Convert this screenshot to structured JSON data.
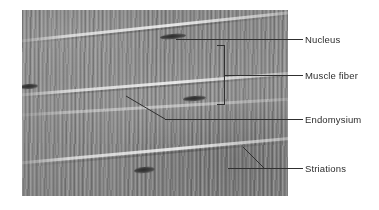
{
  "figure": {
    "type": "light-micrograph-labeled-diagram",
    "background_color": "#ffffff",
    "leader_line_color": "#303030",
    "label_text_color": "#2d2d2d",
    "micrograph": {
      "base_color": "#8e8e8e",
      "left": 22,
      "top": 10,
      "width": 266,
      "height": 186
    }
  },
  "labels": [
    {
      "id": "nucleus",
      "text": "Nucleus",
      "x": 305,
      "y": 34
    },
    {
      "id": "muscle-fiber",
      "text": "Muscle fiber",
      "x": 305,
      "y": 70
    },
    {
      "id": "endomysium",
      "text": "Endomysium",
      "x": 305,
      "y": 114
    },
    {
      "id": "striations",
      "text": "Striations",
      "x": 305,
      "y": 163
    }
  ],
  "structures": {
    "nuclei": [
      {
        "x": 160,
        "y": 34,
        "w": 26,
        "h": 5
      },
      {
        "x": 20,
        "y": 84,
        "w": 16,
        "h": 5
      },
      {
        "x": 183,
        "y": 96,
        "w": 22,
        "h": 5
      },
      {
        "x": 134,
        "y": 167,
        "w": 20,
        "h": 6
      }
    ],
    "endomysium_lines": 4,
    "striation_orientation": "vertical bands perpendicular to fiber axis"
  }
}
